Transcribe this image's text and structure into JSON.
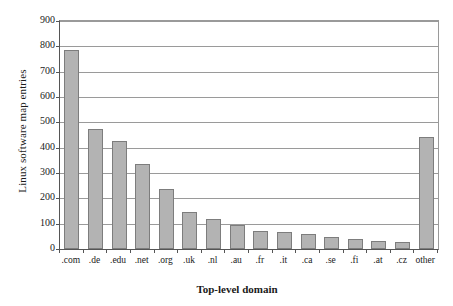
{
  "chart_data": {
    "type": "bar",
    "title": "",
    "xlabel": "Top-level domain",
    "ylabel": "Linux software map entries",
    "ylim": [
      0,
      900
    ],
    "ytick_step": 100,
    "yticks": [
      900,
      800,
      700,
      600,
      500,
      400,
      300,
      200,
      100,
      0
    ],
    "grid": true,
    "legend": "none",
    "bar_fill_color": "#b3b3b3",
    "bar_border_color": "#7d7d7d",
    "axis_color": "#555555",
    "gridline_color": "#9a9a9a",
    "categories": [
      ".com",
      ".de",
      ".edu",
      ".net",
      ".org",
      ".uk",
      ".nl",
      ".au",
      ".fr",
      ".it",
      ".ca",
      ".se",
      ".fi",
      ".at",
      ".cz",
      "other"
    ],
    "values": [
      785,
      475,
      428,
      337,
      238,
      145,
      118,
      93,
      70,
      69,
      58,
      48,
      38,
      31,
      28,
      442
    ]
  }
}
